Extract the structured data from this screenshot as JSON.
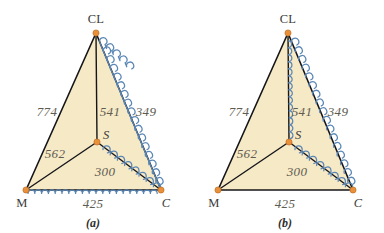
{
  "figure": {
    "background_color": "#ffffff",
    "fill_color": "#f6e9c6",
    "edge_color": "#16161a",
    "squiggle_color": "#5b87b5",
    "vertex_color": "#e8903a",
    "number_color": "#5e5c50"
  },
  "panels": [
    {
      "id": "a",
      "caption": "(a)",
      "vertices": {
        "top": {
          "label": "CL",
          "x": 96,
          "y": 33
        },
        "left": {
          "label": "M",
          "x": 26,
          "y": 190
        },
        "right": {
          "label": "C",
          "x": 161,
          "y": 190
        },
        "interior": {
          "label": "S",
          "x": 97,
          "y": 142
        }
      },
      "edges": [
        {
          "name": "M-CL",
          "value": "774",
          "squiggle": false
        },
        {
          "name": "CL-S",
          "value": "541",
          "squiggle": false
        },
        {
          "name": "CL-C",
          "value": "349",
          "squiggle": true
        },
        {
          "name": "M-S",
          "value": "562",
          "squiggle": false
        },
        {
          "name": "S-C",
          "value": "300",
          "squiggle": true
        },
        {
          "name": "M-C",
          "value": "425",
          "squiggle": true
        }
      ],
      "labels": {
        "n_774": "774",
        "n_541": "541",
        "n_349": "349",
        "n_562": "562",
        "n_300": "300",
        "n_425": "425",
        "v_CL": "CL",
        "v_M": "M",
        "v_C": "C",
        "v_S": "S"
      }
    },
    {
      "id": "b",
      "caption": "(b)",
      "vertices": {
        "top": {
          "label": "CL",
          "x": 288,
          "y": 33
        },
        "left": {
          "label": "M",
          "x": 218,
          "y": 190
        },
        "right": {
          "label": "C",
          "x": 353,
          "y": 190
        },
        "interior": {
          "label": "S",
          "x": 289,
          "y": 142
        }
      },
      "edges": [
        {
          "name": "M-CL",
          "value": "774",
          "squiggle": false
        },
        {
          "name": "CL-S",
          "value": "541",
          "squiggle": true
        },
        {
          "name": "CL-C",
          "value": "349",
          "squiggle": true
        },
        {
          "name": "M-S",
          "value": "562",
          "squiggle": false
        },
        {
          "name": "S-C",
          "value": "300",
          "squiggle": true
        },
        {
          "name": "M-C",
          "value": "425",
          "squiggle": false
        }
      ],
      "labels": {
        "n_774": "774",
        "n_541": "541",
        "n_349": "349",
        "n_562": "562",
        "n_300": "300",
        "n_425": "425",
        "v_CL": "CL",
        "v_M": "M",
        "v_C": "C",
        "v_S": "S"
      }
    }
  ]
}
